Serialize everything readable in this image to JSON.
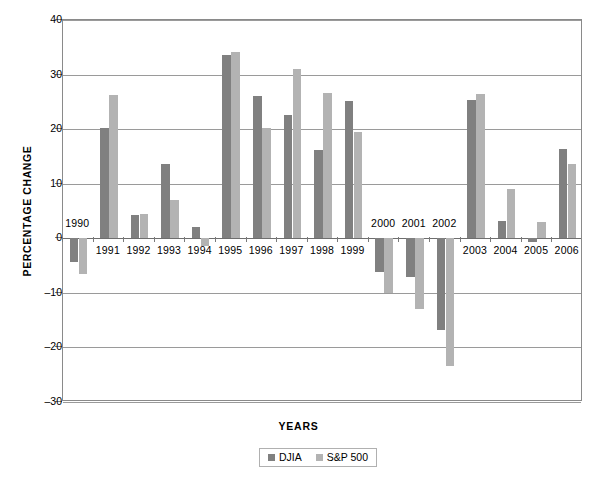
{
  "chart_data": {
    "type": "bar",
    "title": "",
    "xlabel": "YEARS",
    "ylabel": "PERCENTAGE CHANGE",
    "ylim": [
      -30,
      40
    ],
    "yticks": [
      40,
      30,
      20,
      10,
      0,
      -10,
      -20,
      -30
    ],
    "ytick_labels": [
      "40",
      "30",
      "20",
      "10",
      "0",
      "–10",
      "–20",
      "–30"
    ],
    "grid": true,
    "legend_position": "bottom-center",
    "categories": [
      "1990",
      "1991",
      "1992",
      "1993",
      "1994",
      "1995",
      "1996",
      "1997",
      "1998",
      "1999",
      "2000",
      "2001",
      "2002",
      "2003",
      "2004",
      "2005",
      "2006"
    ],
    "series": [
      {
        "name": "DJIA",
        "color": "#808080",
        "values": [
          -4.3,
          20.3,
          4.2,
          13.7,
          2.1,
          33.5,
          26.0,
          22.6,
          16.1,
          25.2,
          -6.2,
          -7.1,
          -16.8,
          25.3,
          3.1,
          -0.6,
          16.3
        ]
      },
      {
        "name": "S&P 500",
        "color": "#b3b3b3",
        "values": [
          -6.6,
          26.3,
          4.5,
          7.1,
          -1.5,
          34.1,
          20.3,
          31.0,
          26.7,
          19.5,
          -10.1,
          -13.0,
          -23.4,
          26.4,
          9.0,
          3.0,
          13.6
        ]
      }
    ]
  },
  "legend": {
    "entries": [
      {
        "label": "DJIA"
      },
      {
        "label": "S&P 500"
      }
    ]
  }
}
